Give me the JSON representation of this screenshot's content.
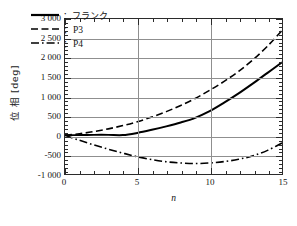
{
  "chart_data": {
    "type": "line",
    "title": "",
    "xlabel": "n",
    "ylabel": "位 相 [deg]",
    "xlim": [
      0,
      15
    ],
    "ylim": [
      -1000,
      3000
    ],
    "grid": true,
    "legend_position": "upper-left-inside",
    "xticks": [
      0,
      5,
      10,
      15
    ],
    "xtick_labels": [
      "0",
      "5",
      "10",
      "15"
    ],
    "xtick_minor_step": 1,
    "yticks": [
      -1000,
      -500,
      0,
      500,
      1000,
      1500,
      2000,
      2500,
      3000
    ],
    "ytick_labels": [
      "-1 000",
      "-500",
      "0",
      "500",
      "1 000",
      "1 500",
      "2 000",
      "2 500",
      "3 000"
    ],
    "ytick_minor_step": 100,
    "x": [
      0,
      1,
      2,
      3,
      4,
      5,
      6,
      7,
      8,
      9,
      10,
      11,
      12,
      13,
      14,
      15
    ],
    "series": [
      {
        "name": "フランク",
        "legend_label": "：フランク",
        "style": "solid",
        "color": "#000000",
        "width": 2.0,
        "values": [
          0,
          5,
          10,
          10,
          5,
          60,
          140,
          230,
          330,
          450,
          620,
          840,
          1080,
          1340,
          1610,
          1880
        ]
      },
      {
        "name": "P3",
        "legend_label": "：P3",
        "style": "dashed",
        "color": "#000000",
        "width": 1.6,
        "values": [
          0,
          40,
          95,
          165,
          250,
          350,
          470,
          610,
          770,
          950,
          1160,
          1390,
          1650,
          1950,
          2300,
          2700
        ]
      },
      {
        "name": "P4",
        "legend_label": "：P4",
        "style": "dashdot",
        "color": "#000000",
        "width": 1.6,
        "values": [
          0,
          -130,
          -250,
          -360,
          -460,
          -555,
          -630,
          -685,
          -715,
          -730,
          -715,
          -680,
          -620,
          -530,
          -390,
          -200
        ]
      }
    ]
  },
  "axes": {
    "ylabel_text": "位 相 [deg]",
    "xlabel_text": "n"
  },
  "legend": {
    "items": [
      {
        "label": "：フランク",
        "style": "solid"
      },
      {
        "label": "：P3",
        "style": "dashed"
      },
      {
        "label": "：P4",
        "style": "dashdot"
      }
    ]
  }
}
